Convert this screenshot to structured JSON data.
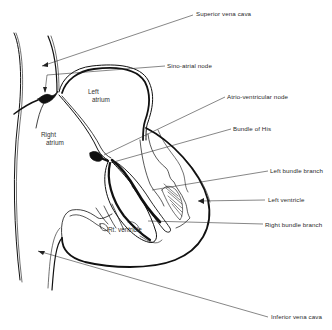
{
  "diagram": {
    "background": "#ffffff",
    "ink": "#111111",
    "labels": {
      "superior_vena_cava": "Superior vena cava",
      "sino_atrial_node": "Sino-atrial node",
      "atrio_ventricular_node": "Atrio-ventricular node",
      "bundle_of_his": "Bundle of His",
      "left_bundle_branch": "Left bundle branch",
      "left_ventricle": "Left ventricle",
      "right_bundle_branch": "Right bundle branch",
      "inferior_vena_cava": "Inferior vena cava"
    },
    "regions": {
      "left_atrium_line1": "Left",
      "left_atrium_line2": "atrium",
      "right_atrium_line1": "Right",
      "right_atrium_line2": "atrium",
      "right_ventricle": "Rt. ventricle"
    }
  }
}
